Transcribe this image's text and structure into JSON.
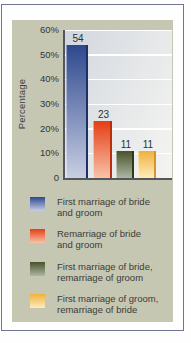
{
  "window": {
    "background_color": "#fefefe",
    "frame_border_color": "#6e7492",
    "panel_color": "#c6c7b2"
  },
  "chart_data": {
    "type": "bar",
    "title": "",
    "xlabel": "",
    "ylabel": "Percentage",
    "ylim": [
      0,
      60
    ],
    "ytick_labels": [
      "60%",
      "50%",
      "40%",
      "30%",
      "20%",
      "10%",
      "0"
    ],
    "grid": true,
    "gridline_color": "#ffffff",
    "axis_color": "#53565b",
    "plot_bg_from": "#d1d6de",
    "plot_bg_to": "#f4f5f2",
    "categories": [
      "First marriage of bride and groom",
      "Remarriage of bride and groom",
      "First marriage of bride, remarriage of groom",
      "First marriage of groom, remarriage of bride"
    ],
    "values": [
      54,
      23,
      11,
      11
    ],
    "bar_colors": [
      {
        "top": "#2d488e",
        "bottom": "#c9cfe3",
        "edge": "#1d3166"
      },
      {
        "top": "#e63d14",
        "bottom": "#f7c3aa",
        "edge": "#b72f0d"
      },
      {
        "top": "#475329",
        "bottom": "#aeb6a3",
        "edge": "#2f3a1b"
      },
      {
        "top": "#f0b13c",
        "bottom": "#fcecbc",
        "edge": "#d6952a"
      }
    ],
    "legend_position": "bottom"
  },
  "legend": {
    "items": [
      {
        "line1": "First marriage of bride",
        "line2": "and groom"
      },
      {
        "line1": "Remarriage of bride",
        "line2": "and groom"
      },
      {
        "line1": "First marriage of bride,",
        "line2": "remarriage of groom"
      },
      {
        "line1": "First marriage of groom,",
        "line2": "remarriage of bride"
      }
    ]
  }
}
